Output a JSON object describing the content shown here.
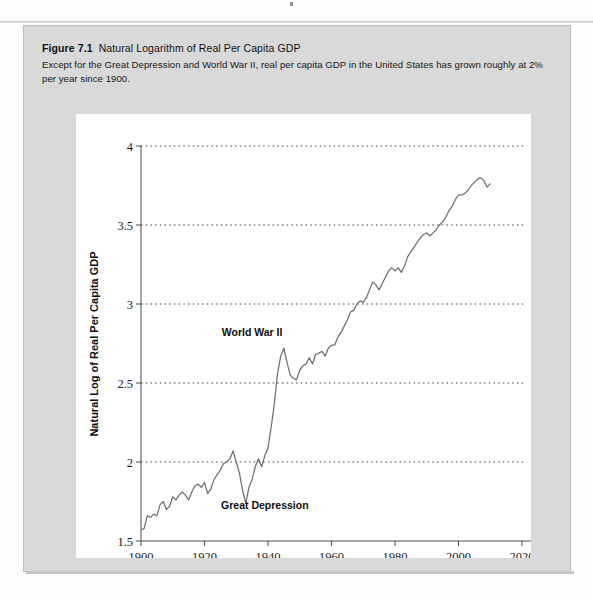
{
  "figure": {
    "label": "Figure 7.1",
    "title": "Natural Logarithm of Real Per Capita GDP",
    "caption": "Except for the Great Depression and World War II, real per capita GDP in the United States has grown roughly at 2% per year since 1900."
  },
  "chart_data": {
    "type": "line",
    "title": "Natural Logarithm of Real Per Capita GDP",
    "xlabel": "Year",
    "ylabel": "Natural Log of Real Per Capita GDP",
    "xlim": [
      1900,
      2020
    ],
    "ylim": [
      1.5,
      4
    ],
    "xticks": [
      1900,
      1920,
      1940,
      1960,
      1980,
      2000,
      2020
    ],
    "xtick_labels": [
      "1900",
      "1920",
      "1940",
      "1960",
      "1980",
      "2000",
      "2020"
    ],
    "yticks": [
      1.5,
      2,
      2.5,
      3,
      3.5,
      4
    ],
    "ytick_labels": [
      "1.5",
      "2",
      "2.5",
      "3",
      "3.5",
      "4"
    ],
    "grid": "horizontal-dotted",
    "legend": null,
    "line_color": "#6e6e6e",
    "annotations": [
      {
        "text": "World War II",
        "x": 1935,
        "y": 2.8
      },
      {
        "text": "Great Depression",
        "x": 1939,
        "y": 1.7
      }
    ],
    "series": [
      {
        "name": "Natural Log of Real Per Capita GDP",
        "x": [
          1900,
          1901,
          1902,
          1903,
          1904,
          1905,
          1906,
          1907,
          1908,
          1909,
          1910,
          1911,
          1912,
          1913,
          1914,
          1915,
          1916,
          1917,
          1918,
          1919,
          1920,
          1921,
          1922,
          1923,
          1924,
          1925,
          1926,
          1927,
          1928,
          1929,
          1930,
          1931,
          1932,
          1933,
          1934,
          1935,
          1936,
          1937,
          1938,
          1939,
          1940,
          1941,
          1942,
          1943,
          1944,
          1945,
          1946,
          1947,
          1948,
          1949,
          1950,
          1951,
          1952,
          1953,
          1954,
          1955,
          1956,
          1957,
          1958,
          1959,
          1960,
          1961,
          1962,
          1963,
          1964,
          1965,
          1966,
          1967,
          1968,
          1969,
          1970,
          1971,
          1972,
          1973,
          1974,
          1975,
          1976,
          1977,
          1978,
          1979,
          1980,
          1981,
          1982,
          1983,
          1984,
          1985,
          1986,
          1987,
          1988,
          1989,
          1990,
          1991,
          1992,
          1993,
          1994,
          1995,
          1996,
          1997,
          1998,
          1999,
          2000,
          2001,
          2002,
          2003,
          2004,
          2005,
          2006,
          2007,
          2008,
          2009,
          2010
        ],
        "values": [
          1.57,
          1.58,
          1.66,
          1.65,
          1.67,
          1.66,
          1.73,
          1.75,
          1.7,
          1.72,
          1.78,
          1.76,
          1.79,
          1.81,
          1.79,
          1.76,
          1.81,
          1.85,
          1.86,
          1.84,
          1.87,
          1.8,
          1.83,
          1.89,
          1.92,
          1.95,
          1.99,
          2.0,
          2.02,
          2.07,
          2.0,
          1.93,
          1.82,
          1.74,
          1.84,
          1.89,
          1.97,
          2.02,
          1.97,
          2.04,
          2.09,
          2.22,
          2.37,
          2.56,
          2.67,
          2.72,
          2.63,
          2.55,
          2.53,
          2.52,
          2.58,
          2.61,
          2.62,
          2.66,
          2.62,
          2.68,
          2.69,
          2.7,
          2.67,
          2.72,
          2.74,
          2.74,
          2.79,
          2.82,
          2.86,
          2.9,
          2.95,
          2.96,
          3.0,
          3.02,
          3.01,
          3.04,
          3.09,
          3.14,
          3.12,
          3.09,
          3.13,
          3.17,
          3.21,
          3.23,
          3.21,
          3.23,
          3.2,
          3.24,
          3.3,
          3.33,
          3.36,
          3.39,
          3.42,
          3.44,
          3.45,
          3.43,
          3.45,
          3.47,
          3.5,
          3.52,
          3.55,
          3.59,
          3.62,
          3.66,
          3.69,
          3.69,
          3.7,
          3.72,
          3.75,
          3.77,
          3.79,
          3.8,
          3.78,
          3.74,
          3.76
        ]
      }
    ]
  },
  "axes": {
    "x_title": "Year",
    "y_title": "Natural Log of Real Per Capita GDP"
  }
}
